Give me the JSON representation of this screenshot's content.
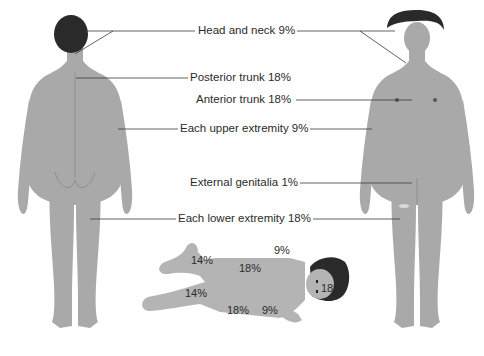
{
  "colors": {
    "skin": "#a9a9a9",
    "skin_dark": "#8f8f8f",
    "hair": "#2a2a2a",
    "line": "#3a3a3a",
    "text": "#2b2b2b",
    "background": "#ffffff"
  },
  "labels": {
    "head_neck": "Head and neck 9%",
    "posterior_trunk": "Posterior trunk 18%",
    "anterior_trunk": "Anterior trunk 18%",
    "upper_extremity": "Each upper extremity 9%",
    "genitalia": "External genitalia 1%",
    "lower_extremity": "Each lower extremity 18%"
  },
  "figures": {
    "adult_back": "Adult, posterior view",
    "adult_front": "Adult, anterior view",
    "infant": "Infant, lying"
  },
  "infant_percentages": {
    "head": "18%",
    "arm_top": "9%",
    "arm_bottom": "9%",
    "trunk_front": "18%",
    "trunk_back": "18%",
    "leg_top": "14%",
    "leg_bottom": "14%"
  }
}
